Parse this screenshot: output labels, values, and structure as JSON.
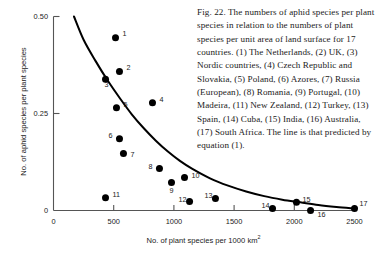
{
  "figure": {
    "number": "Fig. 22.",
    "caption": "Fig. 22. The numbers of aphid species per plant species in relation to the numbers of plant species per unit area of land surface for 17 countries. (1) The Netherlands, (2) UK, (3) Nordic countries, (4) Czech Republic and Slovakia, (5) Poland, (6) Azores, (7) Russia (European), (8) Romania, (9) Portugal, (10) Madeira, (11) New Zealand, (12) Turkey, (13) Spain, (14) Cuba, (15) India, (16) Australia, (17) South Africa. The line is that predicted by equation (1)."
  },
  "chart_data": {
    "type": "scatter",
    "title": "",
    "xlabel": "No. of plant species per 1000 km",
    "xlabel_superscript": "2",
    "ylabel": "No. of aphid species per plant species",
    "xlim": [
      0,
      2500
    ],
    "ylim": [
      0,
      0.5
    ],
    "xticks": [
      0,
      500,
      1000,
      1500,
      2000,
      2500
    ],
    "xtick_labels": [
      "0",
      "500",
      "1000",
      "1500",
      "2000",
      "2500"
    ],
    "yticks": [
      0,
      0.25,
      0.5
    ],
    "ytick_labels": [
      "0",
      "0.25",
      "0.50"
    ],
    "grid": false,
    "legend": false,
    "marker_color": "#000000",
    "line_color": "#000000",
    "axis_color": "#555555",
    "points": [
      {
        "id": "1",
        "country": "The Netherlands",
        "x": 515,
        "y": 0.445,
        "label_dx": 7,
        "label_dy": -4
      },
      {
        "id": "2",
        "country": "UK",
        "x": 548,
        "y": 0.358,
        "label_dx": 7,
        "label_dy": -4
      },
      {
        "id": "3",
        "country": "Nordic countries",
        "x": 432,
        "y": 0.338,
        "label_dx": -1,
        "label_dy": 5
      },
      {
        "id": "4",
        "country": "Czech Republic and Slovakia",
        "x": 822,
        "y": 0.278,
        "label_dx": 7,
        "label_dy": -3
      },
      {
        "id": "5",
        "country": "Poland",
        "x": 523,
        "y": 0.265,
        "label_dx": 7,
        "label_dy": -3
      },
      {
        "id": "6",
        "country": "Azores",
        "x": 548,
        "y": 0.185,
        "label_dx": -11,
        "label_dy": -3
      },
      {
        "id": "7",
        "country": "Russia (European)",
        "x": 581,
        "y": 0.147,
        "label_dx": 7,
        "label_dy": 1
      },
      {
        "id": "8",
        "country": "Romania",
        "x": 880,
        "y": 0.108,
        "label_dx": -11,
        "label_dy": -2
      },
      {
        "id": "9",
        "country": "Portugal",
        "x": 980,
        "y": 0.072,
        "label_dx": -2,
        "label_dy": 8
      },
      {
        "id": "10",
        "country": "Madeira",
        "x": 1088,
        "y": 0.085,
        "label_dx": 7,
        "label_dy": -2
      },
      {
        "id": "11",
        "country": "New Zealand",
        "x": 432,
        "y": 0.033,
        "label_dx": 7,
        "label_dy": -3
      },
      {
        "id": "12",
        "country": "Turkey",
        "x": 1130,
        "y": 0.023,
        "label_dx": -11,
        "label_dy": -2
      },
      {
        "id": "13",
        "country": "Spain",
        "x": 1345,
        "y": 0.031,
        "label_dx": -11,
        "label_dy": -3
      },
      {
        "id": "14",
        "country": "Cuba",
        "x": 1819,
        "y": 0.005,
        "label_dx": -11,
        "label_dy": -3
      },
      {
        "id": "15",
        "country": "India",
        "x": 2018,
        "y": 0.021,
        "label_dx": 6,
        "label_dy": -3
      },
      {
        "id": "16",
        "country": "Australia",
        "x": 2135,
        "y": 0.0,
        "label_dx": 7,
        "label_dy": 4
      },
      {
        "id": "17",
        "country": "South Africa",
        "x": 2500,
        "y": 0.005,
        "label_dx": 5,
        "label_dy": -5
      }
    ],
    "fitted_curve": {
      "description": "line predicted by equation (1)",
      "points": [
        {
          "x": 170,
          "y": 0.5
        },
        {
          "x": 250,
          "y": 0.44
        },
        {
          "x": 350,
          "y": 0.385
        },
        {
          "x": 450,
          "y": 0.335
        },
        {
          "x": 550,
          "y": 0.29
        },
        {
          "x": 650,
          "y": 0.248
        },
        {
          "x": 750,
          "y": 0.212
        },
        {
          "x": 850,
          "y": 0.18
        },
        {
          "x": 950,
          "y": 0.152
        },
        {
          "x": 1050,
          "y": 0.128
        },
        {
          "x": 1150,
          "y": 0.108
        },
        {
          "x": 1300,
          "y": 0.083
        },
        {
          "x": 1450,
          "y": 0.064
        },
        {
          "x": 1600,
          "y": 0.049
        },
        {
          "x": 1750,
          "y": 0.037
        },
        {
          "x": 1900,
          "y": 0.028
        },
        {
          "x": 2050,
          "y": 0.021
        },
        {
          "x": 2200,
          "y": 0.014
        },
        {
          "x": 2350,
          "y": 0.009
        },
        {
          "x": 2500,
          "y": 0.005
        }
      ]
    }
  }
}
